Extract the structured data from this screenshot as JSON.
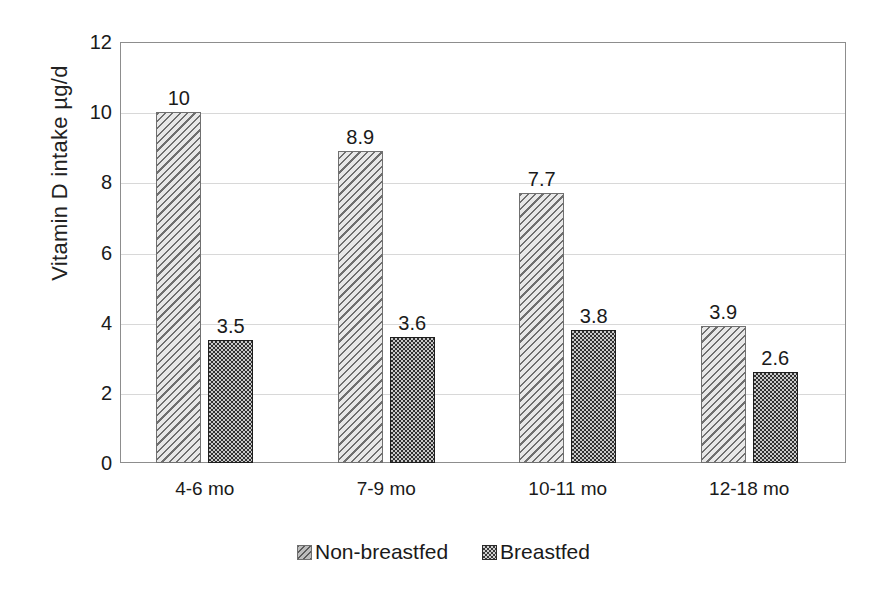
{
  "chart_data": {
    "type": "bar",
    "title": "",
    "xlabel": "",
    "ylabel": "Vitamin D intake  µg/d",
    "categories": [
      "4-6 mo",
      "7-9 mo",
      "10-11 mo",
      "12-18 mo"
    ],
    "series": [
      {
        "name": "Non-breastfed",
        "values": [
          10,
          8.9,
          7.7,
          3.9
        ],
        "value_labels": [
          "10",
          "8.9",
          "7.7",
          "3.9"
        ],
        "fill": "diagonal-hatch-light",
        "color": "#e8e8e8"
      },
      {
        "name": "Breastfed",
        "values": [
          3.5,
          3.6,
          3.8,
          2.6
        ],
        "value_labels": [
          "3.5",
          "3.6",
          "3.8",
          "2.6"
        ],
        "fill": "dotted-dark",
        "color": "#303030"
      }
    ],
    "ylim": [
      0,
      12
    ],
    "yticks": [
      0,
      2,
      4,
      6,
      8,
      10,
      12
    ],
    "ytick_labels": [
      "0",
      "2",
      "4",
      "6",
      "8",
      "10",
      "12"
    ],
    "grid": true,
    "grid_axis": "y",
    "legend_position": "bottom-center",
    "plot_border": true,
    "show_value_labels": true
  },
  "legend": {
    "items": [
      {
        "label": "Non-breastfed"
      },
      {
        "label": "Breastfed"
      }
    ]
  }
}
